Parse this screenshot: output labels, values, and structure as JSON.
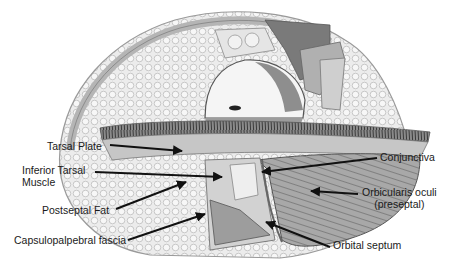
{
  "diagram": {
    "labels": [
      {
        "id": "tarsal-plate",
        "text": "Tarsal Plate",
        "x": 47,
        "y": 141
      },
      {
        "id": "inferior-tarsal-muscle",
        "line1": "Inferior Tarsal",
        "line2": "Muscle",
        "x": 22,
        "y": 165
      },
      {
        "id": "postseptal-fat",
        "text": "Postseptal Fat",
        "x": 42,
        "y": 206
      },
      {
        "id": "capsulopalpebral-fascia",
        "text": "Capsulopalpebral fascia",
        "x": 14,
        "y": 235
      },
      {
        "id": "conjunctiva",
        "text": "Conjunctiva",
        "x": 380,
        "y": 153
      },
      {
        "id": "orbicularis-oculi",
        "line1": "Orbicularis oculi",
        "line2": "(preseptal)",
        "x": 364,
        "y": 188
      },
      {
        "id": "orbital-septum",
        "text": "Orbital septum",
        "x": 333,
        "y": 240
      }
    ],
    "colors": {
      "text": "#1a1a1a",
      "arrow": "#111111",
      "background": "#ffffff"
    }
  }
}
